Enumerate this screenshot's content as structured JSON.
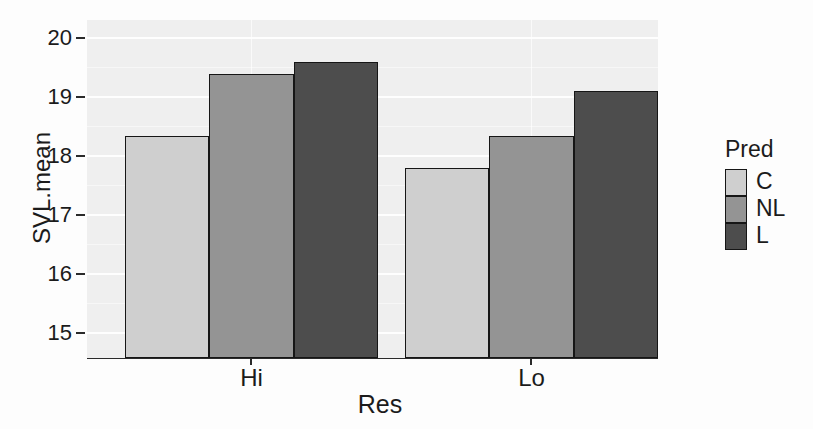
{
  "chart_data": {
    "type": "bar",
    "title": "",
    "xlabel": "Res",
    "ylabel": "SVL.mean",
    "categories": [
      "Hi",
      "Lo"
    ],
    "series": [
      {
        "name": "C",
        "color": "#cfcfcf",
        "values": [
          18.35,
          17.8
        ]
      },
      {
        "name": "NL",
        "color": "#949494",
        "values": [
          19.4,
          18.35
        ]
      },
      {
        "name": "L",
        "color": "#4d4d4d",
        "values": [
          19.6,
          19.1
        ]
      }
    ],
    "legend": {
      "title": "Pred",
      "position": "right"
    },
    "y_ticks": [
      15,
      16,
      17,
      18,
      19,
      20
    ],
    "y_minor_ticks": [
      15.5,
      16.5,
      17.5,
      18.5,
      19.5
    ],
    "ylim": [
      14.58,
      20.31
    ],
    "grid": true,
    "panel_background": "#efefef",
    "gridline_color": "#ffffff",
    "bar_border_color": "#161616",
    "text_color": "#1b1b1b"
  }
}
